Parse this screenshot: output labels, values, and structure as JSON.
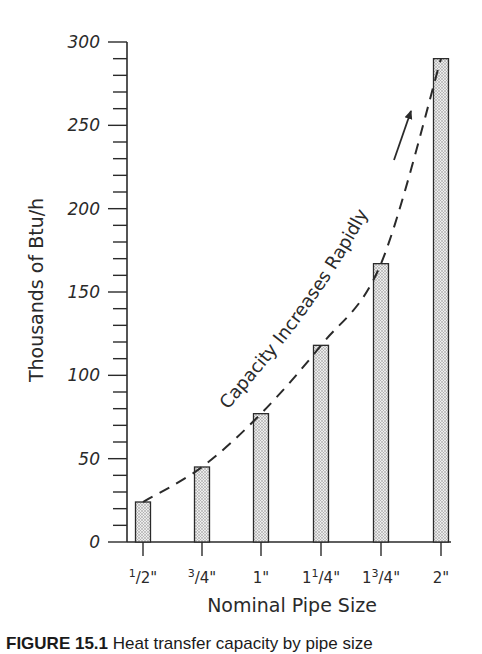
{
  "chart_data": {
    "type": "bar",
    "title": "",
    "xlabel": "Nominal Pipe Size",
    "ylabel": "Thousands of Btu/h",
    "categories": [
      "1/2\"",
      "3/4\"",
      "1\"",
      "1 1/4\"",
      "1 3/4\"",
      "2\""
    ],
    "category_labels": [
      {
        "whole": "",
        "num": "1",
        "den": "2"
      },
      {
        "whole": "",
        "num": "3",
        "den": "4"
      },
      {
        "whole": "1",
        "num": "",
        "den": ""
      },
      {
        "whole": "1",
        "num": "1",
        "den": "4"
      },
      {
        "whole": "1",
        "num": "3",
        "den": "4"
      },
      {
        "whole": "2",
        "num": "",
        "den": ""
      }
    ],
    "values": [
      24,
      45,
      77,
      118,
      167,
      290
    ],
    "ylim": [
      0,
      300
    ],
    "yticks": [
      0,
      50,
      100,
      150,
      200,
      250,
      300
    ],
    "minor_tick_step": 10,
    "grid": false,
    "legend": null,
    "bar_fill": "stippled gray",
    "annotations": [
      {
        "text": "Capacity Increases Rapidly",
        "type": "curved-text-along-dashed-trend-line"
      },
      {
        "type": "arrow",
        "direction": "up-right"
      },
      {
        "type": "dashed-curve",
        "description": "exponential trend through bar tops"
      }
    ]
  },
  "caption": {
    "figure_label": "FIGURE 15.1",
    "text": "Heat transfer capacity by pipe size"
  },
  "colors": {
    "ink": "#2a2a2a",
    "bar_fill": "#d4d4d4",
    "background": "#ffffff"
  }
}
